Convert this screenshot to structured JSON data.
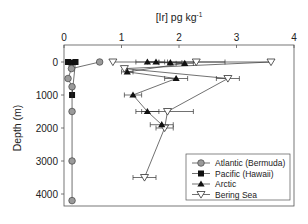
{
  "chart_data": {
    "type": "scatter",
    "title": "",
    "xlabel": "[Ir] pg kg",
    "xlabel_superscript": "-1",
    "ylabel": "Depth (m)",
    "xlim": [
      0,
      4
    ],
    "ylim": [
      0,
      4500
    ],
    "y_inverted": true,
    "x_axis_position": "top",
    "x_ticks": [
      "0",
      "1",
      "2",
      "3",
      "4"
    ],
    "y_ticks": [
      "0",
      "1000",
      "2000",
      "3000",
      "4000"
    ],
    "grid": false,
    "legend_position": "lower right",
    "series": [
      {
        "name": "Atlantic (Bermuda)",
        "marker": "circle",
        "color": "#999999",
        "points": [
          {
            "x": 0.62,
            "y": 0
          },
          {
            "x": 0.13,
            "y": 200
          },
          {
            "x": 0.07,
            "y": 500
          },
          {
            "x": 0.14,
            "y": 750
          },
          {
            "x": 0.14,
            "y": 1500
          },
          {
            "x": 0.14,
            "y": 3000
          },
          {
            "x": 0.14,
            "y": 4200
          }
        ]
      },
      {
        "name": "Pacific (Hawaii)",
        "marker": "square",
        "color": "#111111",
        "points": [
          {
            "x": 0.07,
            "y": 0
          },
          {
            "x": 0.13,
            "y": 20
          },
          {
            "x": 0.2,
            "y": 0
          },
          {
            "x": 0.14,
            "y": 1000
          }
        ]
      },
      {
        "name": "Arctic",
        "marker": "triangle-up",
        "color": "#111111",
        "points": [
          {
            "x": 1.45,
            "y": 0,
            "xerr": 0.2
          },
          {
            "x": 1.6,
            "y": 0,
            "xerr": 0.15
          },
          {
            "x": 1.85,
            "y": 20,
            "xerr": 0.2
          },
          {
            "x": 2.1,
            "y": 40,
            "xerr": 0.15
          },
          {
            "x": 1.1,
            "y": 300,
            "xerr": 0.1
          },
          {
            "x": 1.95,
            "y": 500,
            "xerr": 0.2
          },
          {
            "x": 1.2,
            "y": 1000,
            "xerr": 0.15
          },
          {
            "x": 1.45,
            "y": 1500,
            "xerr": 0.2
          },
          {
            "x": 1.7,
            "y": 1900,
            "xerr": 0.2
          }
        ]
      },
      {
        "name": "Bering Sea",
        "marker": "triangle-down-open",
        "color": "#111111",
        "points": [
          {
            "x": 0.85,
            "y": 0
          },
          {
            "x": 2.3,
            "y": 0,
            "xerr": 0.5
          },
          {
            "x": 3.6,
            "y": 0
          },
          {
            "x": 1.05,
            "y": 200
          },
          {
            "x": 2.85,
            "y": 500,
            "xerr": 0.2
          },
          {
            "x": 1.8,
            "y": 1500,
            "xerr": 0.45
          },
          {
            "x": 1.75,
            "y": 2000,
            "xerr": 0.15
          },
          {
            "x": 1.4,
            "y": 3500,
            "xerr": 0.2
          }
        ]
      }
    ]
  }
}
